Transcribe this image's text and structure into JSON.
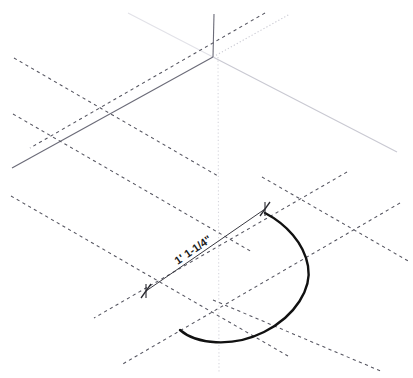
{
  "drawing": {
    "title": "Isometric arc construction drawing",
    "background_color": "#ffffff",
    "canvas": {
      "width": 413,
      "height": 378
    }
  },
  "colors": {
    "axis_solid": "#6b6b78",
    "axis_light": "#c9c9d2",
    "axis_faint": "#e2e2e8",
    "construction_dashed": "#555560",
    "construction_dotted": "#d6d6dd",
    "object_curve": "#111111",
    "dimension_line": "#3a3a42",
    "dimension_text": "#1a1a1a",
    "footer_text": "#b9b9c2"
  },
  "dimension": {
    "label": "1' 1-1/4\"",
    "name": "arc-diameter-dimension",
    "start_point": {
      "x": 146,
      "y": 291
    },
    "end_point": {
      "x": 265,
      "y": 209
    },
    "rotation_deg": -34.6,
    "text_anchor": {
      "x": 195,
      "y": 256
    },
    "tick_style": "slash-cross"
  },
  "origin_vertex": {
    "x": 213,
    "y": 57,
    "name": "isometric-origin"
  },
  "axes": [
    {
      "name": "axis-vertical",
      "style": "solid",
      "color_key": "axis_solid",
      "width": 1.1,
      "x1": 213,
      "y1": 57,
      "x2": 214,
      "y2": 14
    },
    {
      "name": "axis-left-30deg",
      "style": "solid",
      "color_key": "axis_solid",
      "width": 1.1,
      "x1": 213,
      "y1": 57,
      "x2": 12,
      "y2": 168
    },
    {
      "name": "axis-right-30deg",
      "style": "solid",
      "color_key": "axis_light",
      "width": 1.1,
      "x1": 213,
      "y1": 57,
      "x2": 397,
      "y2": 152
    },
    {
      "name": "axis-upper-left-faint",
      "style": "solid",
      "color_key": "axis_faint",
      "width": 1.1,
      "x1": 213,
      "y1": 57,
      "x2": 128,
      "y2": 13
    },
    {
      "name": "axis-upper-right-dotted",
      "style": "dotted",
      "color_key": "axis_light",
      "width": 1.1,
      "x1": 213,
      "y1": 57,
      "x2": 290,
      "y2": 14
    },
    {
      "name": "axis-vertical-dotted-down",
      "style": "dotted",
      "color_key": "construction_dotted",
      "width": 1.1,
      "x1": 218,
      "y1": 57,
      "x2": 219,
      "y2": 372
    }
  ],
  "construction_lines": [
    {
      "name": "construction-dashed-upper-left",
      "style": "dashed",
      "x1": 14,
      "y1": 58,
      "x2": 218,
      "y2": 176
    },
    {
      "name": "construction-dashed-mid-left",
      "style": "dashed",
      "x1": 13,
      "y1": 114,
      "x2": 252,
      "y2": 252
    },
    {
      "name": "construction-dashed-lower-left",
      "style": "dashed",
      "x1": 11,
      "y1": 196,
      "x2": 288,
      "y2": 356
    },
    {
      "name": "construction-dashed-right-upper",
      "style": "dashed",
      "x1": 265,
      "y1": 13,
      "x2": 30,
      "y2": 148
    },
    {
      "name": "construction-dashed-right-mid",
      "style": "dashed",
      "x1": 347,
      "y1": 172,
      "x2": 94,
      "y2": 318
    },
    {
      "name": "construction-dashed-right-lower",
      "style": "dashed",
      "x1": 400,
      "y1": 203,
      "x2": 121,
      "y2": 365
    },
    {
      "name": "construction-dashed-crossing-low",
      "style": "dashed",
      "x1": 262,
      "y1": 177,
      "x2": 410,
      "y2": 262
    },
    {
      "name": "construction-dashed-crossing-bottom",
      "style": "dashed",
      "x1": 213,
      "y1": 300,
      "x2": 383,
      "y2": 372
    }
  ],
  "object_curve": {
    "name": "isometric-arc",
    "stroke_width": 2.4,
    "description": "semi-elliptical arc in isometric projection",
    "path": "M 180 330 C 196 344 232 348 264 332 C 296 316 312 288 308 266 C 304 243 286 224 265 213"
  },
  "footer": {
    "text": "",
    "visible": false
  }
}
